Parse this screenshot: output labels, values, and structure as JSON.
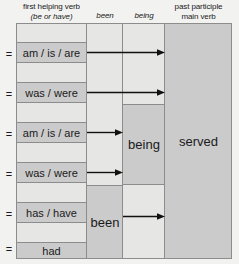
{
  "diagram": {
    "colors": {
      "page_background": "#f2f2f0",
      "cell_filled": "#cbcbcb",
      "cell_empty": "#e6e6e4",
      "grid_line": "#8c8c8c",
      "text": "#1a1a1a",
      "arrow": "#111111"
    },
    "headers": [
      {
        "id": "first-helping-verb",
        "line1": "first helping verb",
        "line2": "(be or have)",
        "line2_italic": true
      },
      {
        "id": "been",
        "line1": "been",
        "italic": true
      },
      {
        "id": "being",
        "line1": "being",
        "italic": true
      },
      {
        "id": "past-participle",
        "line1": "past participle",
        "line2": "main verb"
      }
    ],
    "equals_sign": "=",
    "helping_verb_rows": [
      {
        "index": 0,
        "label": "",
        "filled": false,
        "equals": false
      },
      {
        "index": 1,
        "label": "am / is / are",
        "filled": true,
        "equals": true
      },
      {
        "index": 2,
        "label": "",
        "filled": false,
        "equals": false
      },
      {
        "index": 3,
        "label": "was / were",
        "filled": true,
        "equals": true
      },
      {
        "index": 4,
        "label": "",
        "filled": false,
        "equals": false
      },
      {
        "index": 5,
        "label": "am / is / are",
        "filled": true,
        "equals": true
      },
      {
        "index": 6,
        "label": "",
        "filled": false,
        "equals": false
      },
      {
        "index": 7,
        "label": "was / were",
        "filled": true,
        "equals": true
      },
      {
        "index": 8,
        "label": "",
        "filled": false,
        "equals": false
      },
      {
        "index": 9,
        "label": "has / have",
        "filled": true,
        "equals": true
      },
      {
        "index": 10,
        "label": "",
        "filled": false,
        "equals": false
      },
      {
        "index": 11,
        "label": "had",
        "filled": true,
        "equals": true
      }
    ],
    "merged_cells": [
      {
        "id": "being-cell",
        "column": "being",
        "label": "being"
      },
      {
        "id": "been-cell",
        "column": "been",
        "label": "been"
      },
      {
        "id": "served-cell",
        "column": "past-participle",
        "label": "served"
      }
    ],
    "arrows": [
      {
        "id": "arrow-am-is-are-to-served",
        "from_row": "am / is / are",
        "to_column": "past participle"
      },
      {
        "id": "arrow-was-were-to-served",
        "from_row": "was / were",
        "to_column": "past participle"
      },
      {
        "id": "arrow-am-is-are-to-being",
        "from_row": "am / is / are",
        "to_column": "being"
      },
      {
        "id": "arrow-was-were-to-being",
        "from_row": "was / were",
        "to_column": "being"
      },
      {
        "id": "arrow-been-to-served",
        "from_row": "been",
        "to_column": "past participle"
      }
    ]
  }
}
